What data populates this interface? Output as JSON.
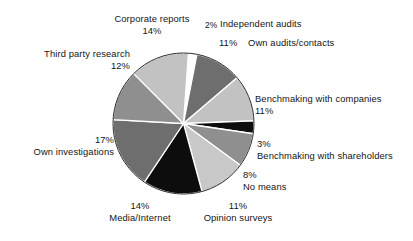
{
  "chart_data": {
    "type": "pie",
    "title": "",
    "subtitle": "",
    "xlabel": "",
    "ylabel": "",
    "legend_position": "none",
    "grid": false,
    "start_angle_deg": -86,
    "direction": "clockwise",
    "total_percent": 101,
    "categories": [
      "Independent audits",
      "Own audits/contacts",
      "Benchmaking with companies",
      "Benchmaking with shareholders",
      "No means",
      "Opinion surveys",
      "Media/Internet",
      "Own investigations",
      "Third party research",
      "Corporate reports"
    ],
    "values": [
      2,
      11,
      11,
      3,
      8,
      11,
      14,
      17,
      12,
      14
    ],
    "slices": [
      {
        "label": "Independent audits",
        "value": 2,
        "percent_text": "2%",
        "color": "#ffffff"
      },
      {
        "label": "Own audits/contacts",
        "value": 11,
        "percent_text": "11%",
        "color": "#6e6e6e"
      },
      {
        "label": "Benchmaking with companies",
        "value": 11,
        "percent_text": "11%",
        "color": "#c2c2c2"
      },
      {
        "label": "Benchmaking with shareholders",
        "value": 3,
        "percent_text": "3%",
        "color": "#0d0d0d"
      },
      {
        "label": "No means",
        "value": 8,
        "percent_text": "8%",
        "color": "#8f8f8f"
      },
      {
        "label": "Opinion surveys",
        "value": 11,
        "percent_text": "11%",
        "color": "#c8c8c8"
      },
      {
        "label": "Media/Internet",
        "value": 14,
        "percent_text": "14%",
        "color": "#0d0d0d"
      },
      {
        "label": "Own investigations",
        "value": 17,
        "percent_text": "17%",
        "color": "#6e6e6e"
      },
      {
        "label": "Third party research",
        "value": 12,
        "percent_text": "12%",
        "color": "#8f8f8f"
      },
      {
        "label": "Corporate reports",
        "value": 14,
        "percent_text": "14%",
        "color": "#c2c2c2"
      }
    ]
  },
  "labels": {
    "corporate_reports": {
      "name": "Corporate reports",
      "pct": "14%"
    },
    "independent_audits": {
      "name": "Independent audits",
      "pct": "2%"
    },
    "own_audits": {
      "name": "Own audits/contacts",
      "pct": "11%"
    },
    "third_party_research": {
      "name": "Third party research",
      "pct": "12%"
    },
    "benchmaking_companies": {
      "name": "Benchmaking with companies",
      "pct": "11%"
    },
    "benchmaking_shareholders": {
      "name": "Benchmaking with shareholders",
      "pct": "3%"
    },
    "no_means": {
      "name": "No means",
      "pct": "8%"
    },
    "opinion_surveys": {
      "name": "Opinion surveys",
      "pct": "11%"
    },
    "media_internet": {
      "name": "Media/Internet",
      "pct": "14%"
    },
    "own_investigations": {
      "name": "Own investigations",
      "pct": "17%"
    }
  }
}
